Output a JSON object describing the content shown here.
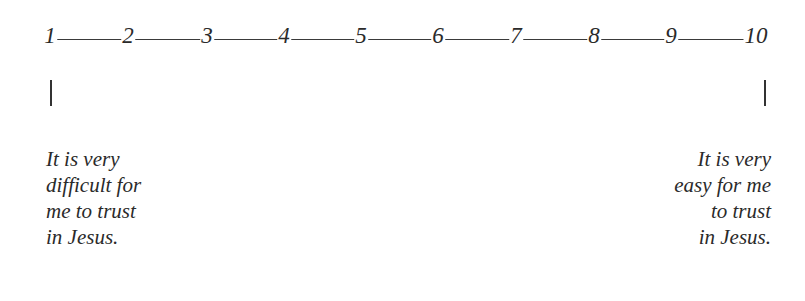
{
  "scale": {
    "numbers": [
      "1",
      "2",
      "3",
      "4",
      "5",
      "6",
      "7",
      "8",
      "9",
      "10"
    ],
    "positions_x": [
      50,
      128,
      207,
      284,
      361,
      438,
      516,
      594,
      671,
      756
    ]
  },
  "anchors": {
    "left": {
      "lines": [
        "It is very",
        "difficult for",
        "me to trust",
        "in Jesus."
      ]
    },
    "right": {
      "lines": [
        "It is very",
        "easy for me",
        "to trust",
        "in Jesus."
      ]
    }
  }
}
